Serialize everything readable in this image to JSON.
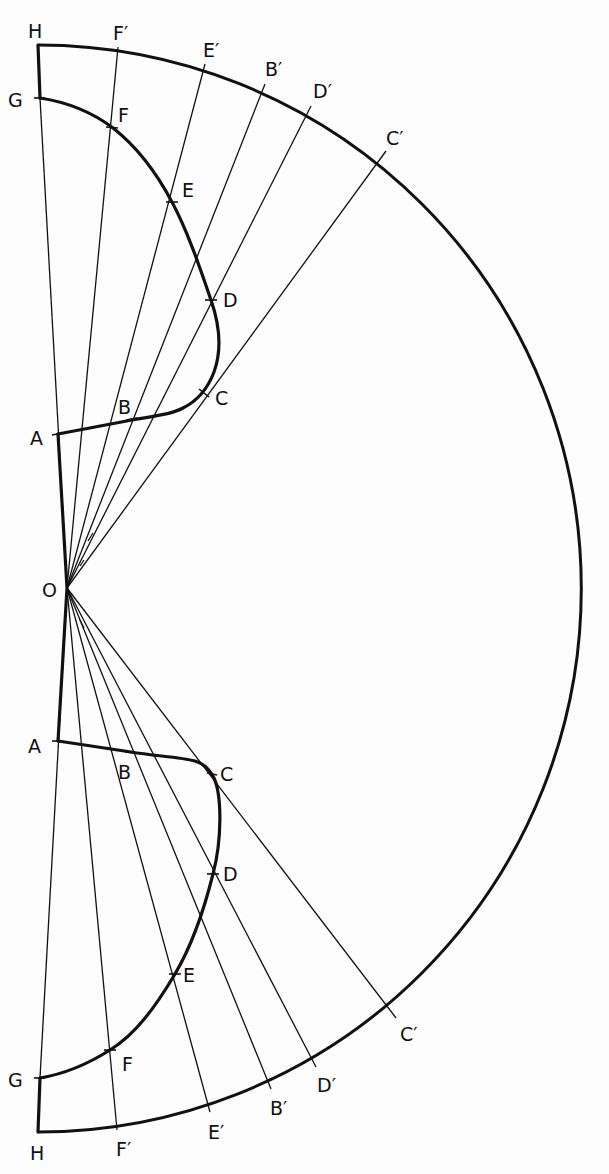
{
  "diagram": {
    "type": "geometric construction (radial projection of profile onto semicircle)",
    "origin": {
      "label": "O",
      "x": 67,
      "y": 588
    },
    "outer_arc": {
      "radius": 542,
      "description": "semicircle centered at O"
    },
    "upper": {
      "profile_points": [
        {
          "label": "A",
          "x": 58,
          "y": 434
        },
        {
          "label": "B",
          "x": 132,
          "y": 418
        },
        {
          "label": "C",
          "x": 205,
          "y": 393
        },
        {
          "label": "D",
          "x": 211,
          "y": 300
        },
        {
          "label": "E",
          "x": 172,
          "y": 202
        },
        {
          "label": "F",
          "x": 113,
          "y": 128
        },
        {
          "label": "G",
          "x": 40,
          "y": 98
        }
      ],
      "arc_points": [
        {
          "label": "H",
          "x": 38,
          "y": 45
        },
        {
          "label": "F′",
          "x": 118,
          "y": 47
        },
        {
          "label": "E′",
          "x": 205,
          "y": 64
        },
        {
          "label": "B′",
          "x": 265,
          "y": 84
        },
        {
          "label": "D′",
          "x": 311,
          "y": 106
        },
        {
          "label": "C′",
          "x": 386,
          "y": 151
        }
      ]
    },
    "lower": {
      "profile_points": [
        {
          "label": "A",
          "x": 58,
          "y": 741
        },
        {
          "label": "B",
          "x": 131,
          "y": 752
        },
        {
          "label": "C",
          "x": 212,
          "y": 775
        },
        {
          "label": "D",
          "x": 213,
          "y": 874
        },
        {
          "label": "E",
          "x": 175,
          "y": 974
        },
        {
          "label": "F",
          "x": 110,
          "y": 1050
        },
        {
          "label": "G",
          "x": 40,
          "y": 1078
        }
      ],
      "arc_points": [
        {
          "label": "H",
          "x": 38,
          "y": 1132
        },
        {
          "label": "F′",
          "x": 117,
          "y": 1130
        },
        {
          "label": "E′",
          "x": 210,
          "y": 1112
        },
        {
          "label": "B′",
          "x": 271,
          "y": 1089
        },
        {
          "label": "D′",
          "x": 316,
          "y": 1067
        },
        {
          "label": "C′",
          "x": 396,
          "y": 1018
        }
      ]
    },
    "labels": {
      "O": "O",
      "upper": {
        "H": "H",
        "G": "G",
        "F": "F",
        "E": "E",
        "D": "D",
        "C": "C",
        "B": "B",
        "A": "A",
        "Fp": "F′",
        "Ep": "E′",
        "Bp": "B′",
        "Dp": "D′",
        "Cp": "C′"
      },
      "lower": {
        "H": "H",
        "G": "G",
        "F": "F",
        "E": "E",
        "D": "D",
        "C": "C",
        "B": "B",
        "A": "A",
        "Fp": "F′",
        "Ep": "E′",
        "Bp": "B′",
        "Dp": "D′",
        "Cp": "C′"
      }
    }
  }
}
